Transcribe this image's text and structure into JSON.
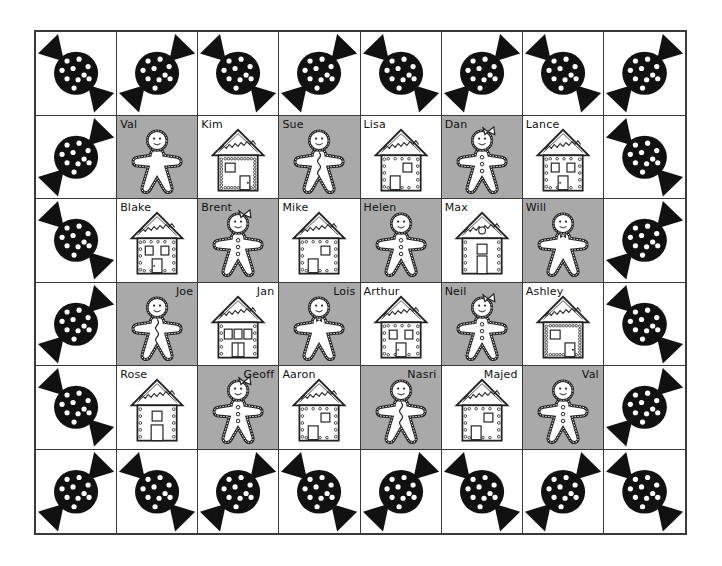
{
  "board": {
    "title": "Gingerbread seating chart",
    "columns": 8,
    "rows": 6,
    "colors": {
      "gray_tile": "#a9a9a9",
      "white_tile": "#ffffff",
      "candy": "#111111",
      "grid_line": "#3a3a3a"
    },
    "border_icon": "candy-icon",
    "interior": [
      [
        {
          "name": "Val",
          "type": "gingerbread",
          "variant": "plain",
          "label_pos": "left"
        },
        {
          "name": "Kim",
          "type": "house",
          "variant": "A",
          "label_pos": "left"
        },
        {
          "name": "Sue",
          "type": "gingerbread",
          "variant": "squiggle",
          "label_pos": "left"
        },
        {
          "name": "Lisa",
          "type": "house",
          "variant": "B",
          "label_pos": "left"
        },
        {
          "name": "Dan",
          "type": "gingerbread",
          "variant": "bow",
          "label_pos": "left"
        },
        {
          "name": "Lance",
          "type": "house",
          "variant": "C",
          "label_pos": "left"
        }
      ],
      [
        {
          "name": "Blake",
          "type": "house",
          "variant": "C",
          "label_pos": "left"
        },
        {
          "name": "Brent",
          "type": "gingerbread",
          "variant": "bow",
          "label_pos": "left"
        },
        {
          "name": "Mike",
          "type": "house",
          "variant": "B",
          "label_pos": "left"
        },
        {
          "name": "Helen",
          "type": "gingerbread",
          "variant": "buttons",
          "label_pos": "left"
        },
        {
          "name": "Max",
          "type": "house",
          "variant": "D",
          "label_pos": "left"
        },
        {
          "name": "Will",
          "type": "gingerbread",
          "variant": "tie",
          "label_pos": "left"
        }
      ],
      [
        {
          "name": "Joe",
          "type": "gingerbread",
          "variant": "squiggle",
          "label_pos": "right"
        },
        {
          "name": "Jan",
          "type": "house",
          "variant": "E",
          "label_pos": "right"
        },
        {
          "name": "Lois",
          "type": "gingerbread",
          "variant": "tie",
          "label_pos": "right"
        },
        {
          "name": "Arthur",
          "type": "house",
          "variant": "C",
          "label_pos": "left"
        },
        {
          "name": "Neil",
          "type": "gingerbread",
          "variant": "bow",
          "label_pos": "left"
        },
        {
          "name": "Ashley",
          "type": "house",
          "variant": "A",
          "label_pos": "left"
        }
      ],
      [
        {
          "name": "Rose",
          "type": "house",
          "variant": "F",
          "label_pos": "left"
        },
        {
          "name": "Geoff",
          "type": "gingerbread",
          "variant": "bow",
          "label_pos": "right"
        },
        {
          "name": "Aaron",
          "type": "house",
          "variant": "B",
          "label_pos": "left"
        },
        {
          "name": "Nasri",
          "type": "gingerbread",
          "variant": "squiggle",
          "label_pos": "right"
        },
        {
          "name": "Majed",
          "type": "house",
          "variant": "B",
          "label_pos": "right"
        },
        {
          "name": "Val",
          "type": "gingerbread",
          "variant": "buttons",
          "label_pos": "right"
        }
      ]
    ]
  }
}
